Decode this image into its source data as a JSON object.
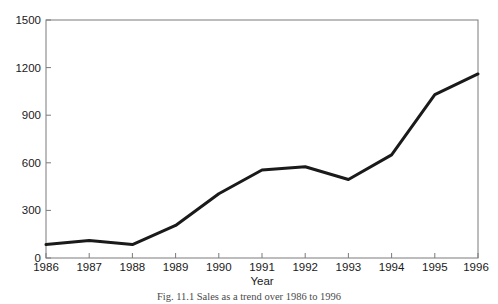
{
  "figure": {
    "caption": "Fig. 11.1  Sales as a trend over 1986 to 1996",
    "background_color": "#ffffff"
  },
  "chart_data": {
    "type": "line",
    "title": "",
    "xlabel": "Year",
    "ylabel": "",
    "x": [
      "1986",
      "1987",
      "1988",
      "1989",
      "1990",
      "1991",
      "1992",
      "1993",
      "1994",
      "1995",
      "1996"
    ],
    "categories": [
      "1986",
      "1987",
      "1988",
      "1989",
      "1990",
      "1991",
      "1992",
      "1993",
      "1994",
      "1995",
      "1996"
    ],
    "values": [
      85,
      110,
      85,
      205,
      405,
      555,
      575,
      495,
      650,
      1030,
      1160
    ],
    "series": [
      {
        "name": "Sales",
        "values": [
          85,
          110,
          85,
          205,
          405,
          555,
          575,
          495,
          650,
          1030,
          1160
        ],
        "color": "#1a1a1a",
        "line_width": 3,
        "markers": "none"
      }
    ],
    "xlim": [
      1986,
      1996
    ],
    "ylim": [
      0,
      1500
    ],
    "yticks": [
      0,
      300,
      600,
      900,
      1200,
      1500
    ],
    "ytick_labels": [
      "0",
      "300",
      "600",
      "900",
      "1200",
      "1500"
    ],
    "xticks": [
      "1986",
      "1987",
      "1988",
      "1989",
      "1990",
      "1991",
      "1992",
      "1993",
      "1994",
      "1995",
      "1996"
    ],
    "grid": false,
    "legend": "none",
    "frame_color": "#7a7a7a"
  }
}
